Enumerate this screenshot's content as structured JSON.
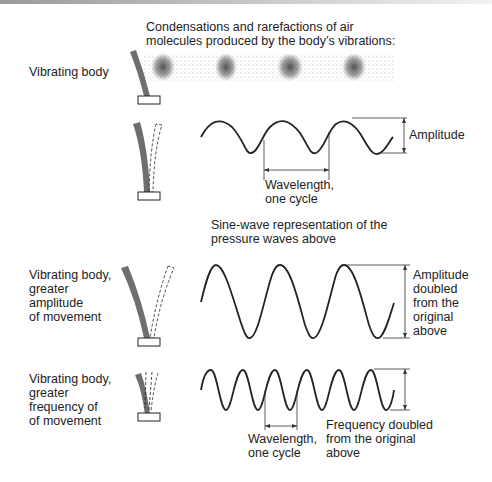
{
  "diagram": {
    "title_caption": "Condensations and rarefactions of air\nmolecules produced by the body’s vibrations:",
    "rows": [
      {
        "label": "Vibrating body",
        "visual": "air molecule density band with 4 condensations"
      },
      {
        "label": "",
        "visual": "sine wave, 3 cycles",
        "annotations": {
          "amplitude": "Amplitude",
          "wavelength": "Wavelength,\none cycle"
        }
      },
      {
        "label": "Vibrating body,\ngreater\namplitude\nof movement",
        "visual": "sine wave, double amplitude",
        "annotations": {
          "amplitude": "Amplitude\ndoubled\nfrom the\noriginal\nabove"
        }
      },
      {
        "label": "Vibrating body,\ngreater\nfrequency of\nof movement",
        "visual": "sine wave, double frequency",
        "annotations": {
          "wavelength": "Wavelength,\none cycle",
          "frequency": "Frequency doubled\nfrom the original\nabove"
        }
      }
    ],
    "sine_caption": "Sine-wave representation of the\npressure waves above",
    "colors": {
      "body_fill": "#6e6e6e",
      "line": "#222222",
      "background": "#ffffff"
    }
  }
}
